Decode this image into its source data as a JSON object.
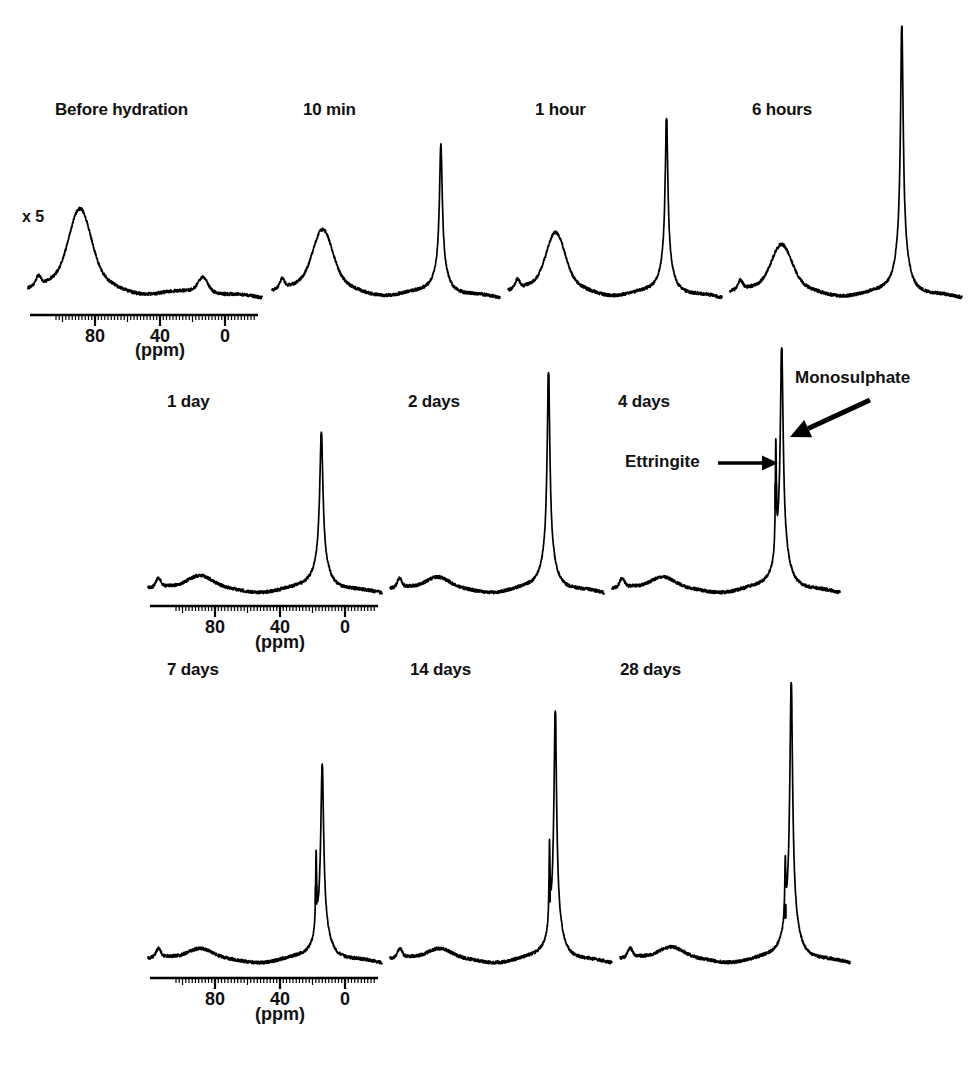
{
  "figure": {
    "title_visible": false,
    "background_color": "#ffffff",
    "ink_color": "#000000",
    "scale_note": "x 5",
    "axis_unit": "(ppm)",
    "axis_ticks": [
      "80",
      "40",
      "0"
    ],
    "bottom_caption": ""
  },
  "annotations": [
    {
      "label": "Ettringite",
      "target": "ettringite-shoulder-peak"
    },
    {
      "label": "Monosulphate",
      "target": "monosulphate-main-peak"
    }
  ],
  "rows": [
    {
      "id": "row-1",
      "panels": [
        {
          "label": "Before hydration"
        },
        {
          "label": "10 min"
        },
        {
          "label": "1 hour"
        },
        {
          "label": "6 hours"
        }
      ]
    },
    {
      "id": "row-2",
      "panels": [
        {
          "label": "1 day"
        },
        {
          "label": "2 days"
        },
        {
          "label": "4 days"
        }
      ]
    },
    {
      "id": "row-3",
      "panels": [
        {
          "label": "7 days"
        },
        {
          "label": "14 days"
        },
        {
          "label": "28 days"
        }
      ]
    }
  ],
  "chart_data": {
    "type": "line",
    "title": "",
    "subtitle": "",
    "xlabel": "(ppm)",
    "ylabel": "",
    "xlim": [
      110,
      -25
    ],
    "grid": false,
    "legend_position": "none",
    "tick_labels": [
      "80",
      "40",
      "0"
    ],
    "tick_values": [
      80,
      40,
      0
    ],
    "minor_tick_step": 2,
    "annotations": [
      {
        "text": "Ettringite",
        "points_to_ppm": 13.0,
        "series": "4 days"
      },
      {
        "text": "Monosulphate",
        "points_to_ppm": 9.5,
        "series": "4 days"
      },
      {
        "text": "x 5",
        "applies_to": "Before hydration"
      }
    ],
    "series": [
      {
        "name": "Before hydration",
        "row": 1,
        "vertical_scale": 5,
        "peaks": [
          {
            "ppm": 80,
            "rel_height": 0.6,
            "width_ppm": 14,
            "type": "broad",
            "assignment": "tetrahedral Al (anhydrous clinker)"
          },
          {
            "ppm": 9,
            "rel_height": 0.12,
            "width_ppm": 6,
            "type": "broad",
            "assignment": "octahedral Al"
          }
        ],
        "baseline_noise": 0.02
      },
      {
        "name": "10 min",
        "row": 1,
        "vertical_scale": 1,
        "peaks": [
          {
            "ppm": 80,
            "rel_height": 0.46,
            "width_ppm": 13,
            "type": "broad",
            "assignment": "tetrahedral Al (anhydrous clinker)"
          },
          {
            "ppm": 10,
            "rel_height": 1.0,
            "width_ppm": 2.0,
            "type": "sharp",
            "assignment": "aluminate hydrate"
          }
        ],
        "baseline_noise": 0.02
      },
      {
        "name": "1 hour",
        "row": 1,
        "vertical_scale": 1,
        "peaks": [
          {
            "ppm": 80,
            "rel_height": 0.44,
            "width_ppm": 13,
            "type": "broad",
            "assignment": "tetrahedral Al (anhydrous clinker)"
          },
          {
            "ppm": 10,
            "rel_height": 1.18,
            "width_ppm": 2.0,
            "type": "sharp",
            "assignment": "ettringite"
          }
        ],
        "baseline_noise": 0.02
      },
      {
        "name": "6 hours",
        "row": 1,
        "vertical_scale": 1,
        "peaks": [
          {
            "ppm": 80,
            "rel_height": 0.36,
            "width_ppm": 13,
            "type": "broad",
            "assignment": "tetrahedral Al (anhydrous clinker)"
          },
          {
            "ppm": 10,
            "rel_height": 1.8,
            "width_ppm": 1.8,
            "type": "sharp",
            "assignment": "ettringite"
          }
        ],
        "baseline_noise": 0.02
      },
      {
        "name": "1 day",
        "row": 2,
        "vertical_scale": 1,
        "peaks": [
          {
            "ppm": 80,
            "rel_height": 0.12,
            "width_ppm": 16,
            "type": "broad",
            "assignment": "residual tetrahedral Al"
          },
          {
            "ppm": 10,
            "rel_height": 1.05,
            "width_ppm": 2.2,
            "type": "sharp",
            "assignment": "ettringite / monosulphate"
          }
        ],
        "baseline_noise": 0.02
      },
      {
        "name": "2 days",
        "row": 2,
        "vertical_scale": 1,
        "peaks": [
          {
            "ppm": 80,
            "rel_height": 0.11,
            "width_ppm": 16,
            "type": "broad",
            "assignment": "residual tetrahedral Al"
          },
          {
            "ppm": 10,
            "rel_height": 1.45,
            "width_ppm": 2.0,
            "type": "sharp",
            "assignment": "ettringite / monosulphate"
          }
        ],
        "baseline_noise": 0.02
      },
      {
        "name": "4 days",
        "row": 2,
        "vertical_scale": 1,
        "peaks": [
          {
            "ppm": 80,
            "rel_height": 0.11,
            "width_ppm": 16,
            "type": "broad",
            "assignment": "residual tetrahedral Al"
          },
          {
            "ppm": 13,
            "rel_height": 0.72,
            "width_ppm": 0.7,
            "type": "shoulder",
            "assignment": "ettringite"
          },
          {
            "ppm": 9.5,
            "rel_height": 1.62,
            "width_ppm": 2.0,
            "type": "sharp",
            "assignment": "monosulphate"
          }
        ],
        "baseline_noise": 0.02
      },
      {
        "name": "7 days",
        "row": 3,
        "vertical_scale": 1,
        "peaks": [
          {
            "ppm": 80,
            "rel_height": 0.1,
            "width_ppm": 16,
            "type": "broad",
            "assignment": "residual tetrahedral Al"
          },
          {
            "ppm": 13,
            "rel_height": 0.5,
            "width_ppm": 0.7,
            "type": "shoulder",
            "assignment": "ettringite"
          },
          {
            "ppm": 9.5,
            "rel_height": 1.3,
            "width_ppm": 2.0,
            "type": "sharp",
            "assignment": "monosulphate"
          }
        ],
        "baseline_noise": 0.02
      },
      {
        "name": "14 days",
        "row": 3,
        "vertical_scale": 1,
        "peaks": [
          {
            "ppm": 80,
            "rel_height": 0.1,
            "width_ppm": 16,
            "type": "broad",
            "assignment": "residual tetrahedral Al"
          },
          {
            "ppm": 13,
            "rel_height": 0.52,
            "width_ppm": 0.7,
            "type": "shoulder",
            "assignment": "ettringite"
          },
          {
            "ppm": 9.5,
            "rel_height": 1.66,
            "width_ppm": 1.9,
            "type": "sharp",
            "assignment": "monosulphate"
          }
        ],
        "baseline_noise": 0.02
      },
      {
        "name": "28 days",
        "row": 3,
        "vertical_scale": 1,
        "peaks": [
          {
            "ppm": 80,
            "rel_height": 0.11,
            "width_ppm": 16,
            "type": "broad",
            "assignment": "residual tetrahedral Al"
          },
          {
            "ppm": 13,
            "rel_height": 0.38,
            "width_ppm": 0.7,
            "type": "shoulder",
            "assignment": "ettringite"
          },
          {
            "ppm": 9.5,
            "rel_height": 1.85,
            "width_ppm": 1.9,
            "type": "sharp",
            "assignment": "monosulphate"
          }
        ],
        "baseline_noise": 0.02
      }
    ]
  },
  "layout": {
    "rows": [
      {
        "baseline_y": 297,
        "label_y": 100,
        "axis": {
          "x0": 30,
          "x1": 258,
          "y": 315,
          "tick_x": [
            95,
            160,
            225
          ],
          "unit_x": 160,
          "unit_y": 340
        },
        "panels": [
          {
            "name": "Before hydration",
            "x0": 28,
            "x1": 262,
            "label_x": 55
          },
          {
            "name": "10 min",
            "x0": 272,
            "x1": 500,
            "label_x": 303
          },
          {
            "name": "1 hour",
            "x0": 508,
            "x1": 722,
            "label_x": 535
          },
          {
            "name": "6 hours",
            "x0": 730,
            "x1": 962,
            "label_x": 752
          }
        ]
      },
      {
        "baseline_y": 592,
        "label_y": 392,
        "axis": {
          "x0": 150,
          "x1": 378,
          "y": 606,
          "tick_x": [
            215,
            280,
            345
          ],
          "unit_x": 280,
          "unit_y": 632
        },
        "panels": [
          {
            "name": "1 day",
            "x0": 148,
            "x1": 382,
            "label_x": 167
          },
          {
            "name": "2 days",
            "x0": 390,
            "x1": 604,
            "label_x": 408
          },
          {
            "name": "4 days",
            "x0": 612,
            "x1": 840,
            "label_x": 618
          }
        ]
      },
      {
        "baseline_y": 962,
        "label_y": 660,
        "axis": {
          "x0": 150,
          "x1": 378,
          "y": 978,
          "tick_x": [
            215,
            280,
            345
          ],
          "unit_x": 280,
          "unit_y": 1004
        },
        "panels": [
          {
            "name": "7 days",
            "x0": 148,
            "x1": 382,
            "label_x": 167
          },
          {
            "name": "14 days",
            "x0": 390,
            "x1": 612,
            "label_x": 410
          },
          {
            "name": "28 days",
            "x0": 620,
            "x1": 850,
            "label_x": 620
          }
        ]
      }
    ],
    "scale_note_pos": {
      "x": 22,
      "y": 208
    },
    "annotation_pos": {
      "ettringite": {
        "text_x": 625,
        "text_y": 452,
        "arrow": [
          [
            718,
            463
          ],
          [
            778,
            463
          ]
        ]
      },
      "monosulphate": {
        "text_x": 795,
        "text_y": 368,
        "arrow": [
          [
            870,
            400
          ],
          [
            790,
            437
          ]
        ]
      }
    }
  }
}
